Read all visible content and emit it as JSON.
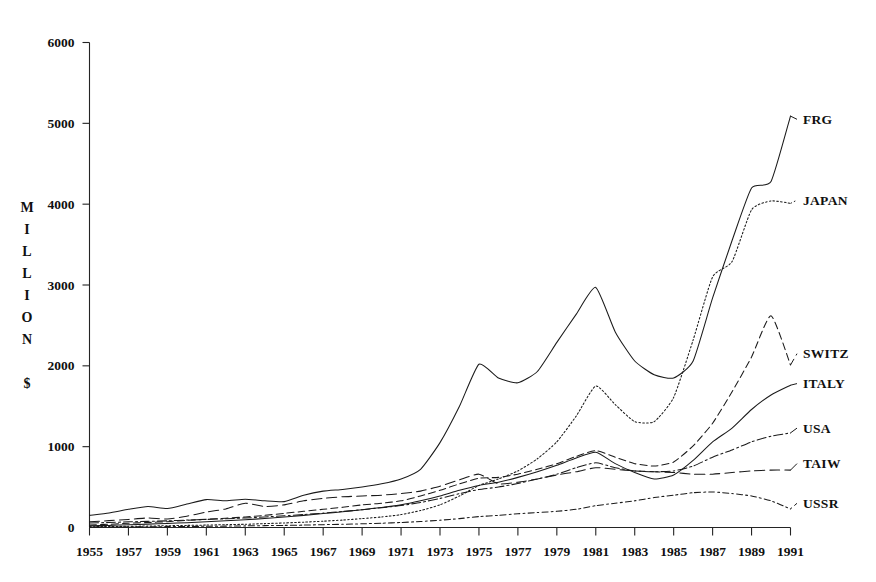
{
  "chart_data": {
    "type": "line",
    "title": "",
    "subtitle": "",
    "xlabel": "",
    "ylabel": "MILLION $",
    "ylabel_letters": [
      "M",
      "I",
      "L",
      "L",
      "I",
      "O",
      "N",
      "",
      "$"
    ],
    "grid": false,
    "legend_position": "right-inline-labels",
    "xlim": [
      1955,
      1991
    ],
    "ylim": [
      0,
      6000
    ],
    "y_ticks": [
      0,
      1000,
      2000,
      3000,
      4000,
      5000,
      6000
    ],
    "y_tick_labels": [
      "0",
      "1000",
      "2000",
      "3000",
      "4000",
      "5000",
      "6000"
    ],
    "x_ticks": [
      1955,
      1957,
      1959,
      1961,
      1963,
      1965,
      1967,
      1969,
      1971,
      1973,
      1975,
      1977,
      1979,
      1981,
      1983,
      1985,
      1987,
      1989,
      1991
    ],
    "x_tick_labels": [
      "1955",
      "1957",
      "1959",
      "1961",
      "1963",
      "1965",
      "1967",
      "1969",
      "1971",
      "1973",
      "1975",
      "1977",
      "1979",
      "1981",
      "1983",
      "1985",
      "1987",
      "1989",
      "1991"
    ],
    "x": [
      1955,
      1956,
      1957,
      1958,
      1959,
      1960,
      1961,
      1962,
      1963,
      1964,
      1965,
      1966,
      1967,
      1968,
      1969,
      1970,
      1971,
      1972,
      1973,
      1974,
      1975,
      1976,
      1977,
      1978,
      1979,
      1980,
      1981,
      1982,
      1983,
      1984,
      1985,
      1986,
      1987,
      1988,
      1989,
      1990,
      1991
    ],
    "series": [
      {
        "name": "FRG",
        "label": "FRG",
        "style": "solid",
        "color": "#1a1a1a",
        "values": [
          150,
          180,
          225,
          260,
          235,
          290,
          345,
          330,
          350,
          330,
          320,
          400,
          450,
          470,
          500,
          540,
          600,
          720,
          1050,
          1500,
          2020,
          1850,
          1790,
          1930,
          2290,
          2640,
          2970,
          2420,
          2060,
          1890,
          1850,
          2060,
          2840,
          3550,
          4200,
          4280,
          5090
        ]
      },
      {
        "name": "JAPAN",
        "label": "JAPAN",
        "style": "dotted-fine",
        "color": "#2a2a2a",
        "values": [
          10,
          12,
          15,
          18,
          22,
          26,
          30,
          35,
          40,
          48,
          56,
          66,
          78,
          92,
          110,
          130,
          160,
          210,
          280,
          390,
          520,
          600,
          700,
          850,
          1060,
          1380,
          1750,
          1520,
          1310,
          1310,
          1610,
          2320,
          3100,
          3290,
          3930,
          4040,
          4010
        ]
      },
      {
        "name": "SWITZ",
        "label": "SWITZ",
        "style": "dashed",
        "color": "#1f1f1f",
        "values": [
          30,
          40,
          52,
          62,
          72,
          88,
          102,
          115,
          130,
          150,
          175,
          200,
          225,
          250,
          280,
          300,
          330,
          390,
          460,
          540,
          610,
          620,
          660,
          720,
          790,
          880,
          950,
          870,
          790,
          760,
          810,
          1010,
          1290,
          1680,
          2110,
          2620,
          2010
        ]
      },
      {
        "name": "ITALY",
        "label": "ITALY",
        "style": "solid",
        "color": "#1a1a1a",
        "values": [
          20,
          26,
          34,
          42,
          50,
          60,
          72,
          84,
          96,
          112,
          130,
          150,
          172,
          195,
          220,
          248,
          280,
          330,
          390,
          460,
          520,
          560,
          620,
          690,
          770,
          860,
          930,
          790,
          680,
          600,
          650,
          830,
          1060,
          1230,
          1460,
          1640,
          1760
        ]
      },
      {
        "name": "USA",
        "label": "USA",
        "style": "dash-dot",
        "color": "#222222",
        "values": [
          55,
          62,
          70,
          76,
          82,
          92,
          100,
          108,
          118,
          130,
          145,
          160,
          178,
          198,
          220,
          245,
          272,
          310,
          360,
          420,
          470,
          500,
          545,
          600,
          660,
          740,
          800,
          740,
          700,
          690,
          700,
          760,
          870,
          960,
          1060,
          1130,
          1170
        ]
      },
      {
        "name": "TAIW",
        "label": "TAIW",
        "style": "dash-long",
        "color": "#2a2a2a",
        "values": [
          70,
          85,
          100,
          118,
          105,
          140,
          190,
          230,
          300,
          260,
          280,
          330,
          360,
          380,
          390,
          400,
          420,
          450,
          510,
          590,
          660,
          540,
          560,
          600,
          650,
          690,
          740,
          720,
          700,
          690,
          680,
          660,
          660,
          680,
          700,
          710,
          710
        ]
      },
      {
        "name": "USSR",
        "label": "USSR",
        "style": "dotted-sparse",
        "color": "#303030",
        "values": [
          5,
          6,
          8,
          9,
          11,
          13,
          15,
          17,
          20,
          23,
          26,
          30,
          35,
          40,
          46,
          53,
          62,
          74,
          90,
          110,
          135,
          150,
          170,
          185,
          200,
          225,
          270,
          300,
          330,
          370,
          400,
          430,
          440,
          420,
          390,
          330,
          230
        ]
      }
    ],
    "series_label_positions": [
      {
        "name": "FRG",
        "label_value": 5050
      },
      {
        "name": "JAPAN",
        "label_value": 4050
      },
      {
        "name": "SWITZ",
        "label_value": 2150
      },
      {
        "name": "ITALY",
        "label_value": 1780
      },
      {
        "name": "USA",
        "label_value": 1230
      },
      {
        "name": "TAIW",
        "label_value": 790
      },
      {
        "name": "USSR",
        "label_value": 300
      }
    ]
  }
}
